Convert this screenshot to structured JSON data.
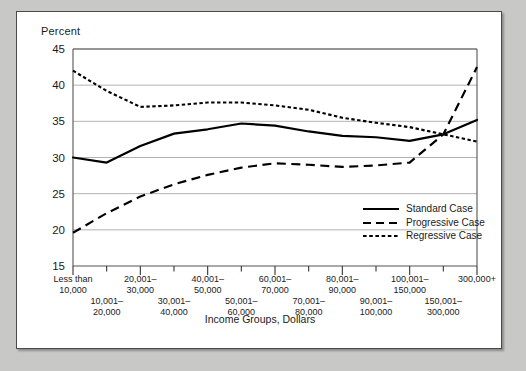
{
  "chart_data": {
    "type": "line",
    "title": "",
    "ylabel": "Percent",
    "xlabel": "Income Groups, Dollars",
    "ylim": [
      15,
      45
    ],
    "yticks": [
      15,
      20,
      25,
      30,
      35,
      40,
      45
    ],
    "grid": true,
    "legend_position": "inside-lower-right",
    "categories": [
      "Less than 10,000",
      "10,001-20,000",
      "20,001-30,000",
      "30,001-40,000",
      "40,001-50,000",
      "50,001-60,000",
      "60,001-70,000",
      "70,001-80,000",
      "80,001-90,000",
      "90,001-100,000",
      "100,001-150,000",
      "150,001-300,000",
      "300,000+"
    ],
    "categories_display": [
      {
        "top": "Less than",
        "bottom": "10,000",
        "row": 0
      },
      {
        "top": "10,001–",
        "bottom": "20,000",
        "row": 1
      },
      {
        "top": "20,001–",
        "bottom": "30,000",
        "row": 0
      },
      {
        "top": "30,001–",
        "bottom": "40,000",
        "row": 1
      },
      {
        "top": "40,001–",
        "bottom": "50,000",
        "row": 0
      },
      {
        "top": "50,001–",
        "bottom": "60,000",
        "row": 1
      },
      {
        "top": "60,001–",
        "bottom": "70,000",
        "row": 0
      },
      {
        "top": "70,001–",
        "bottom": "80,000",
        "row": 1
      },
      {
        "top": "80,001–",
        "bottom": "90,000",
        "row": 0
      },
      {
        "top": "90,001–",
        "bottom": "100,000",
        "row": 1
      },
      {
        "top": "100,001–",
        "bottom": "150,000",
        "row": 0
      },
      {
        "top": "150,001–",
        "bottom": "300,000",
        "row": 1
      },
      {
        "top": "300,000+",
        "bottom": "",
        "row": 0
      }
    ],
    "series": [
      {
        "name": "Standard Case",
        "style": "solid",
        "color": "#000000",
        "values": [
          30.0,
          29.3,
          31.6,
          33.3,
          33.9,
          34.7,
          34.4,
          33.6,
          33.0,
          32.8,
          32.3,
          33.2,
          35.2
        ]
      },
      {
        "name": "Progressive Case",
        "style": "dashed",
        "color": "#000000",
        "values": [
          19.6,
          22.3,
          24.6,
          26.3,
          27.6,
          28.6,
          29.2,
          29.0,
          28.7,
          28.9,
          29.3,
          33.2,
          42.5
        ]
      },
      {
        "name": "Regressive Case",
        "style": "dotted",
        "color": "#000000",
        "values": [
          42.0,
          39.2,
          37.0,
          37.2,
          37.6,
          37.6,
          37.2,
          36.6,
          35.5,
          34.8,
          34.2,
          33.2,
          32.2
        ]
      }
    ]
  },
  "legend": {
    "items": [
      {
        "label": "Standard Case",
        "style": "solid"
      },
      {
        "label": "Progressive Case",
        "style": "dashed"
      },
      {
        "label": "Regressive Case",
        "style": "dotted"
      }
    ]
  }
}
